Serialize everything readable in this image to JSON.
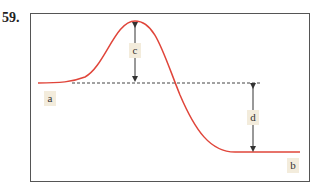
{
  "question_number": "59.",
  "labels": {
    "a": "a",
    "b": "b",
    "c": "c",
    "d": "d"
  },
  "colors": {
    "curve": "#e0453a",
    "dashed": "#444444",
    "arrow": "#333333",
    "label_bg": "#f3ecdc",
    "frame": "#555555"
  }
}
